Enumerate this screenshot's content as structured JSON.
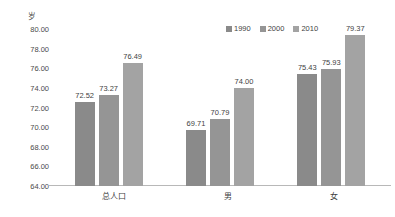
{
  "chart_data": {
    "type": "bar",
    "title": "",
    "subtitle": "",
    "xlabel": "",
    "ylabel": "岁",
    "unit_label": "岁",
    "categories": [
      "总人口",
      "男",
      "女"
    ],
    "series": [
      {
        "name": "1990",
        "values": [
          72.52,
          69.71,
          75.43
        ],
        "color": "#8a8a8a"
      },
      {
        "name": "2000",
        "values": [
          73.27,
          70.79,
          75.93
        ],
        "color": "#959595"
      },
      {
        "name": "2010",
        "values": [
          76.49,
          74.0,
          79.37
        ],
        "color": "#a3a3a3"
      }
    ],
    "data_labels": [
      [
        "72.52",
        "73.27",
        "76.49"
      ],
      [
        "69.71",
        "70.79",
        "74.00"
      ],
      [
        "75.43",
        "75.93",
        "79.37"
      ]
    ],
    "ylim": [
      64.0,
      80.0
    ],
    "ytick_step": 2.0,
    "yticks": [
      "80.00",
      "78.00",
      "76.00",
      "74.00",
      "72.00",
      "70.00",
      "68.00",
      "66.00",
      "64.00"
    ],
    "ytick_values": [
      80.0,
      78.0,
      76.0,
      74.0,
      72.0,
      70.0,
      68.0,
      66.0,
      64.0
    ],
    "grid": false,
    "legend_position": "top-right",
    "legend": [
      "1990",
      "2000",
      "2010"
    ],
    "axis_color": "#b8b8b8",
    "background": "#ffffff"
  }
}
